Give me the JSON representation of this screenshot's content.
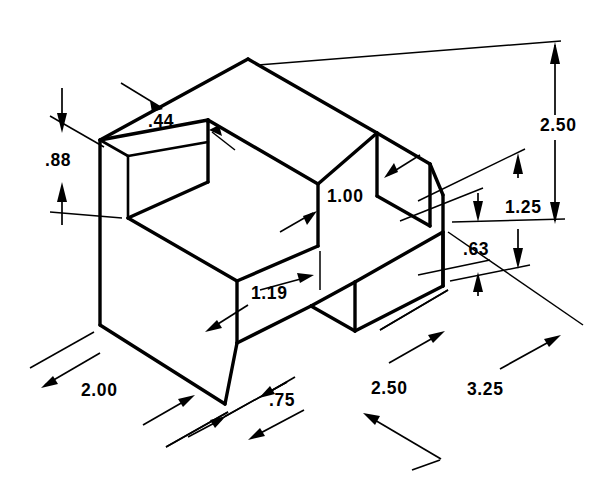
{
  "drawing": {
    "type": "isometric-technical-drawing",
    "title": "Isometric pictorial of a notched block",
    "units": "inches",
    "background_color": "#ffffff",
    "line_color": "#000000",
    "dimensions": [
      {
        "id": "d44",
        "label": ".44",
        "value": 0.44,
        "placement": "top-left-wall-thickness"
      },
      {
        "id": "d88",
        "label": ".88",
        "value": 0.88,
        "placement": "left-vertical-upper"
      },
      {
        "id": "d100",
        "label": "1.00",
        "value": 1.0,
        "placement": "center-right-vertical"
      },
      {
        "id": "d119",
        "label": "1.19",
        "value": 1.19,
        "placement": "pocket-front-depth"
      },
      {
        "id": "d250r",
        "label": "2.50",
        "value": 2.5,
        "placement": "right-overall-height"
      },
      {
        "id": "d125",
        "label": "1.25",
        "value": 1.25,
        "placement": "right-middle-height"
      },
      {
        "id": "d63",
        "label": ".63",
        "value": 0.63,
        "placement": "right-lower-height"
      },
      {
        "id": "d200",
        "label": "2.00",
        "value": 2.0,
        "placement": "bottom-left-width"
      },
      {
        "id": "d75",
        "label": ".75",
        "value": 0.75,
        "placement": "bottom-notch-width"
      },
      {
        "id": "d250b",
        "label": "2.50",
        "value": 2.5,
        "placement": "bottom-middle-length"
      },
      {
        "id": "d325",
        "label": "3.25",
        "value": 3.25,
        "placement": "bottom-overall-length"
      }
    ]
  }
}
